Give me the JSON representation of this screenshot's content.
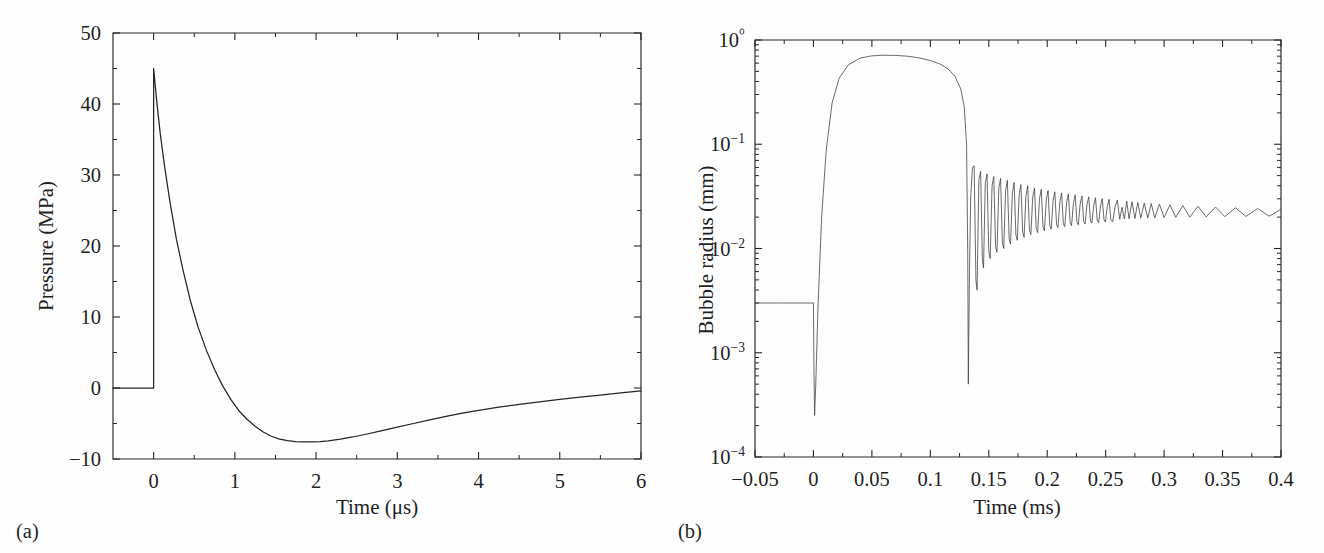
{
  "figure": {
    "background_color": "#fefefe",
    "line_color": "#242424",
    "panels": [
      {
        "label": "(a)",
        "xlabel": "Time (μs)",
        "ylabel": "Pressure (MPa)"
      },
      {
        "label": "(b)",
        "xlabel": "Time (ms)",
        "ylabel": "Bubble radius (mm)"
      }
    ]
  },
  "chart_data": [
    {
      "type": "line",
      "panel": "a",
      "title": "",
      "xlabel": "Time (μs)",
      "ylabel": "Pressure (MPa)",
      "xscale": "linear",
      "yscale": "linear",
      "xlim": [
        -0.5,
        6.0
      ],
      "ylim": [
        -10,
        50
      ],
      "xticks": [
        0,
        1,
        2,
        3,
        4,
        5,
        6
      ],
      "xtick_labels": [
        "0",
        "1",
        "2",
        "3",
        "4",
        "5",
        "6"
      ],
      "yticks": [
        -10,
        0,
        10,
        20,
        30,
        40,
        50
      ],
      "ytick_labels": [
        "−10",
        "0",
        "10",
        "20",
        "30",
        "40",
        "50"
      ],
      "grid": false,
      "legend": null,
      "series": [
        {
          "name": "Lithotripter shock wave pressure",
          "x": [
            -0.5,
            -0.4,
            -0.3,
            -0.2,
            -0.1,
            -0.02,
            0.0,
            0.0,
            0.04,
            0.08,
            0.13,
            0.2,
            0.28,
            0.36,
            0.45,
            0.55,
            0.65,
            0.75,
            0.85,
            0.95,
            1.05,
            1.15,
            1.25,
            1.35,
            1.45,
            1.55,
            1.65,
            1.75,
            1.85,
            1.95,
            2.05,
            2.15,
            2.3,
            2.45,
            2.6,
            2.8,
            3.0,
            3.2,
            3.4,
            3.6,
            3.8,
            4.0,
            4.25,
            4.5,
            4.75,
            5.0,
            5.25,
            5.5,
            5.75,
            6.0
          ],
          "y": [
            0,
            0,
            0,
            0,
            0,
            0,
            0,
            45.0,
            40.2,
            36.0,
            31.6,
            26.3,
            21.0,
            16.7,
            12.4,
            8.5,
            5.3,
            2.6,
            0.3,
            -1.6,
            -3.2,
            -4.4,
            -5.4,
            -6.2,
            -6.8,
            -7.2,
            -7.4,
            -7.55,
            -7.6,
            -7.6,
            -7.55,
            -7.45,
            -7.2,
            -6.9,
            -6.55,
            -6.05,
            -5.5,
            -5.0,
            -4.5,
            -4.0,
            -3.55,
            -3.15,
            -2.7,
            -2.3,
            -1.95,
            -1.6,
            -1.3,
            -1.0,
            -0.7,
            -0.4
          ]
        }
      ],
      "annotations": {
        "peak_pressure_MPa": 45,
        "peak_time_us": 0,
        "min_pressure_MPa": -7.6,
        "min_time_us": 2.0,
        "baseline_before_shock_MPa": 0
      }
    },
    {
      "type": "line",
      "panel": "b",
      "title": "",
      "xlabel": "Time (ms)",
      "ylabel": "Bubble radius (mm)",
      "xscale": "linear",
      "yscale": "log",
      "xlim": [
        -0.05,
        0.4
      ],
      "ylim": [
        0.0001,
        1.0
      ],
      "xticks": [
        -0.05,
        0,
        0.05,
        0.1,
        0.15,
        0.2,
        0.25,
        0.3,
        0.35,
        0.4
      ],
      "xtick_labels": [
        "−0.05",
        "0",
        "0.05",
        "0.1",
        "0.15",
        "0.2",
        "0.25",
        "0.3",
        "0.35",
        "0.4"
      ],
      "yticks": [
        0.0001,
        0.001,
        0.01,
        0.1,
        1.0
      ],
      "ytick_labels": [
        "10−4",
        "10−3",
        "10−2",
        "10−1",
        "10⁰"
      ],
      "grid": false,
      "legend": null,
      "series": [
        {
          "name": "Bubble radius evolution",
          "x": [
            -0.05,
            -0.04,
            -0.03,
            -0.02,
            -0.01,
            -0.002,
            0.0,
            0.0005,
            0.001,
            0.002,
            0.004,
            0.007,
            0.011,
            0.016,
            0.022,
            0.03,
            0.04,
            0.05,
            0.06,
            0.07,
            0.08,
            0.09,
            0.1,
            0.108,
            0.115,
            0.121,
            0.126,
            0.129,
            0.131,
            0.132,
            0.1325,
            0.1335,
            0.1345,
            0.136,
            0.1375,
            0.139,
            0.14,
            0.1415,
            0.143,
            0.1445,
            0.1455,
            0.147,
            0.1485,
            0.15,
            0.1512,
            0.1528,
            0.1543,
            0.1558,
            0.157,
            0.1586,
            0.1601,
            0.1616,
            0.1628,
            0.1644,
            0.1659,
            0.1674,
            0.1686,
            0.1702,
            0.1717,
            0.1732,
            0.1744,
            0.176,
            0.1775,
            0.179,
            0.1802,
            0.1818,
            0.1833,
            0.1848,
            0.186,
            0.1876,
            0.1891,
            0.1906,
            0.1918,
            0.1934,
            0.1949,
            0.1964,
            0.1976,
            0.1992,
            0.2007,
            0.2022,
            0.2034,
            0.205,
            0.2065,
            0.208,
            0.2092,
            0.2108,
            0.2123,
            0.2138,
            0.215,
            0.2166,
            0.2181,
            0.2196,
            0.2208,
            0.2224,
            0.2239,
            0.2254,
            0.2266,
            0.2282,
            0.2297,
            0.2312,
            0.2324,
            0.234,
            0.2355,
            0.237,
            0.2382,
            0.2398,
            0.2413,
            0.2428,
            0.244,
            0.2456,
            0.2471,
            0.2486,
            0.2498,
            0.2514,
            0.2529,
            0.2544,
            0.256,
            0.258,
            0.26,
            0.262,
            0.264,
            0.266,
            0.268,
            0.27,
            0.2725,
            0.275,
            0.2775,
            0.28,
            0.283,
            0.286,
            0.289,
            0.292,
            0.296,
            0.3,
            0.305,
            0.31,
            0.316,
            0.322,
            0.329,
            0.336,
            0.344,
            0.352,
            0.361,
            0.37,
            0.38,
            0.39,
            0.4
          ],
          "y": [
            0.003,
            0.003,
            0.003,
            0.003,
            0.003,
            0.003,
            0.003,
            0.0006,
            0.00025,
            0.0005,
            0.003,
            0.02,
            0.09,
            0.25,
            0.43,
            0.58,
            0.67,
            0.705,
            0.715,
            0.712,
            0.7,
            0.675,
            0.635,
            0.59,
            0.53,
            0.45,
            0.34,
            0.23,
            0.1,
            0.009,
            0.0005,
            0.006,
            0.03,
            0.06,
            0.062,
            0.005,
            0.004,
            0.045,
            0.055,
            0.008,
            0.0065,
            0.042,
            0.052,
            0.0095,
            0.008,
            0.04,
            0.049,
            0.0105,
            0.0092,
            0.038,
            0.047,
            0.0115,
            0.01,
            0.036,
            0.045,
            0.0125,
            0.011,
            0.034,
            0.043,
            0.0135,
            0.012,
            0.033,
            0.041,
            0.0143,
            0.0128,
            0.032,
            0.04,
            0.015,
            0.0136,
            0.031,
            0.038,
            0.0156,
            0.0142,
            0.03,
            0.037,
            0.0161,
            0.0148,
            0.0293,
            0.036,
            0.0166,
            0.0153,
            0.0287,
            0.035,
            0.017,
            0.0158,
            0.0281,
            0.0342,
            0.0174,
            0.0162,
            0.0276,
            0.0334,
            0.0177,
            0.0166,
            0.0271,
            0.0327,
            0.018,
            0.0169,
            0.0267,
            0.032,
            0.0182,
            0.0172,
            0.0263,
            0.0313,
            0.0184,
            0.0175,
            0.0259,
            0.0307,
            0.0186,
            0.0177,
            0.0256,
            0.0301,
            0.0188,
            0.0179,
            0.0253,
            0.0296,
            0.0189,
            0.0181,
            0.025,
            0.0291,
            0.0191,
            0.0248,
            0.0192,
            0.0285,
            0.0193,
            0.0281,
            0.0194,
            0.0277,
            0.0195,
            0.0273,
            0.0196,
            0.027,
            0.0197,
            0.0266,
            0.0198,
            0.0262,
            0.0199,
            0.0258,
            0.02,
            0.0254,
            0.0201,
            0.025,
            0.0202,
            0.0246,
            0.0203,
            0.0242,
            0.0204,
            0.0238,
            0.0205,
            0.0234,
            0.0206,
            0.023,
            0.0207,
            0.0226,
            0.0207,
            0.0222
          ]
        }
      ],
      "annotations": {
        "initial_radius_mm": 0.003,
        "first_collapse_min_mm": 0.00025,
        "max_radius_mm": 0.715,
        "max_radius_time_ms": 0.065,
        "main_collapse_time_ms": 0.132,
        "main_collapse_min_mm": 0.0005,
        "asymptotic_radius_mm": 0.021
      }
    }
  ]
}
